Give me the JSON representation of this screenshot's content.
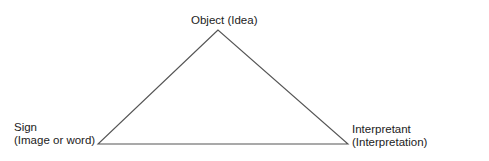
{
  "diagram": {
    "type": "semiotic-triangle",
    "line_color": "#555555",
    "vertices": {
      "apex": {
        "x": 218,
        "y": 30
      },
      "left": {
        "x": 98,
        "y": 144
      },
      "right": {
        "x": 348,
        "y": 144
      }
    },
    "nodes": {
      "object": {
        "line1": "Object (Idea)"
      },
      "sign": {
        "line1": "Sign",
        "line2": "(Image or word)"
      },
      "interpretant": {
        "line1": "Interpretant",
        "line2": "(Interpretation)"
      }
    }
  }
}
